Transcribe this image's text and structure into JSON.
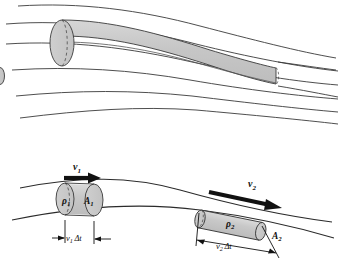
{
  "figure": {
    "stroke_color": "#2b2b2b",
    "fill_color": "#c9c9c9",
    "fill_color_dark": "#b5b5b5",
    "background": "#ffffff"
  },
  "top_panel": {
    "name": "flow-tube-streamlines",
    "tube_label": "flow tube",
    "streamline_count": 5
  },
  "bottom_panel": {
    "name": "continuity-elements",
    "element1": {
      "velocity_label": "v",
      "velocity_sub": "1",
      "density_label": "ρ",
      "density_sub": "1",
      "area_label": "A",
      "area_sub": "1",
      "length_label": "v",
      "length_sub": "1",
      "length_suffix": "Δt"
    },
    "element2": {
      "velocity_label": "v",
      "velocity_sub": "2",
      "density_label": "ρ",
      "density_sub": "2",
      "area_label": "A",
      "area_sub": "2",
      "length_label": "v",
      "length_sub": "2",
      "length_suffix": "Δt"
    }
  }
}
